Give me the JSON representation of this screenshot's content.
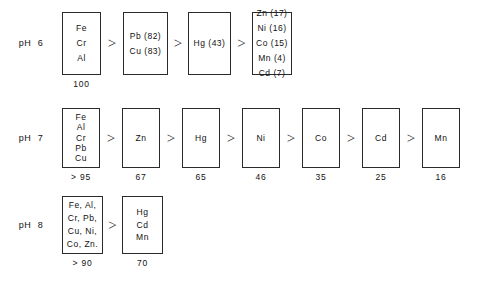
{
  "figure": {
    "separator": ">",
    "background_color": "#ffffff",
    "line_color": "#2b2b2b"
  },
  "rows": [
    {
      "ph_label": "pH  6",
      "boxes": [
        {
          "lines": [
            "Fe",
            "Cr",
            "Al"
          ],
          "value": "100"
        },
        {
          "lines": [
            "Pb (82)",
            "Cu (83)"
          ],
          "value": ""
        },
        {
          "lines": [
            "Hg (43)"
          ],
          "value": ""
        },
        {
          "lines": [
            "Zn (17)",
            "Ni (16)",
            "Co (15)",
            "Mn (4)",
            "Cd (7)"
          ],
          "value": ""
        }
      ]
    },
    {
      "ph_label": "pH  7",
      "boxes": [
        {
          "lines": [
            "Fe",
            "Al",
            "Cr",
            "Pb",
            "Cu"
          ],
          "value": "> 95"
        },
        {
          "lines": [
            "Zn"
          ],
          "value": "67"
        },
        {
          "lines": [
            "Hg"
          ],
          "value": "65"
        },
        {
          "lines": [
            "Ni"
          ],
          "value": "46"
        },
        {
          "lines": [
            "Co"
          ],
          "value": "35"
        },
        {
          "lines": [
            "Cd"
          ],
          "value": "25"
        },
        {
          "lines": [
            "Mn"
          ],
          "value": "16"
        }
      ]
    },
    {
      "ph_label": "pH  8",
      "boxes": [
        {
          "lines": [
            "Fe, Al,",
            "Cr, Pb,",
            "Cu, Ni,",
            "Co, Zn."
          ],
          "value": "> 90"
        },
        {
          "lines": [
            "Hg",
            "Cd",
            "Mn"
          ],
          "value": "70"
        }
      ]
    }
  ],
  "chart_data": {
    "type": "diagram",
    "title": "",
    "series": [
      {
        "name": "pH 6",
        "groups": [
          {
            "elements": [
              "Fe",
              "Cr",
              "Al"
            ],
            "percent": 100
          },
          {
            "elements": [
              "Pb",
              "Cu"
            ],
            "percent_by_element": {
              "Pb": 82,
              "Cu": 83
            }
          },
          {
            "elements": [
              "Hg"
            ],
            "percent_by_element": {
              "Hg": 43
            }
          },
          {
            "elements": [
              "Zn",
              "Ni",
              "Co",
              "Mn",
              "Cd"
            ],
            "percent_by_element": {
              "Zn": 17,
              "Ni": 16,
              "Co": 15,
              "Mn": 4,
              "Cd": 7
            }
          }
        ]
      },
      {
        "name": "pH 7",
        "groups": [
          {
            "elements": [
              "Fe",
              "Al",
              "Cr",
              "Pb",
              "Cu"
            ],
            "percent": "> 95"
          },
          {
            "elements": [
              "Zn"
            ],
            "percent": 67
          },
          {
            "elements": [
              "Hg"
            ],
            "percent": 65
          },
          {
            "elements": [
              "Ni"
            ],
            "percent": 46
          },
          {
            "elements": [
              "Co"
            ],
            "percent": 35
          },
          {
            "elements": [
              "Cd"
            ],
            "percent": 25
          },
          {
            "elements": [
              "Mn"
            ],
            "percent": 16
          }
        ]
      },
      {
        "name": "pH 8",
        "groups": [
          {
            "elements": [
              "Fe",
              "Al",
              "Cr",
              "Pb",
              "Cu",
              "Ni",
              "Co",
              "Zn"
            ],
            "percent": "> 90"
          },
          {
            "elements": [
              "Hg",
              "Cd",
              "Mn"
            ],
            "percent": 70
          }
        ]
      }
    ]
  }
}
